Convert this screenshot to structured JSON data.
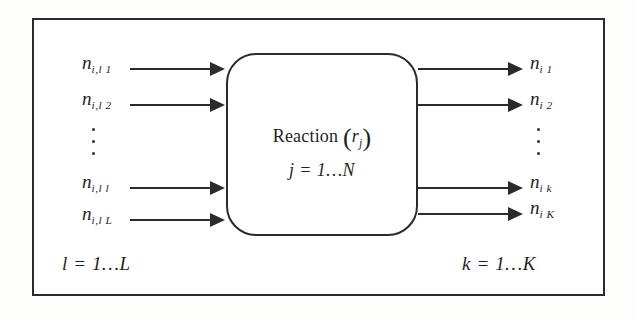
{
  "figure": {
    "frame_color": "#2b2b2b",
    "background": "#ffffff"
  },
  "reaction_block": {
    "label_prefix": "Reaction",
    "open_paren": "(",
    "close_paren": ")",
    "rate_symbol": "r",
    "rate_subscript": "j",
    "index_line": "j = 1…N"
  },
  "inputs": {
    "ellipsis_after_index": 2,
    "range_label": "l = 1…L",
    "items": [
      {
        "symbol": "n",
        "subscript": "i,l 1"
      },
      {
        "symbol": "n",
        "subscript": "i,l 2"
      },
      {
        "symbol": "n",
        "subscript": "i,l l"
      },
      {
        "symbol": "n",
        "subscript": "i,l L"
      }
    ]
  },
  "outputs": {
    "ellipsis_after_index": 2,
    "range_label": "k = 1…K",
    "items": [
      {
        "symbol": "n",
        "subscript": "i 1"
      },
      {
        "symbol": "n",
        "subscript": "i 2"
      },
      {
        "symbol": "n",
        "subscript": "i k"
      },
      {
        "symbol": "n",
        "subscript": "i K"
      }
    ]
  }
}
